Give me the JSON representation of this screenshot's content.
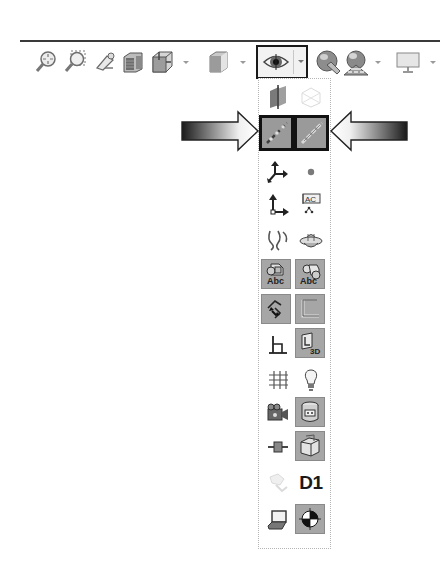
{
  "toolbar": {
    "items": [
      {
        "name": "zoom-to-fit",
        "icon": "zoom-to-fit-icon",
        "has_dropdown": false
      },
      {
        "name": "zoom-to-area",
        "icon": "zoom-to-area-icon",
        "has_dropdown": false
      },
      {
        "name": "previous-view",
        "icon": "previous-view-icon",
        "has_dropdown": false
      },
      {
        "name": "section-view",
        "icon": "section-view-icon",
        "has_dropdown": false
      },
      {
        "name": "view-orientation",
        "icon": "view-orientation-icon",
        "has_dropdown": true
      },
      {
        "name": "display-style",
        "icon": "display-style-icon",
        "has_dropdown": true
      },
      {
        "name": "hide-show-items",
        "icon": "eye-icon",
        "has_dropdown": true,
        "active": true
      },
      {
        "name": "edit-appearance",
        "icon": "edit-appearance-icon",
        "has_dropdown": false
      },
      {
        "name": "apply-scene",
        "icon": "apply-scene-icon",
        "has_dropdown": true
      },
      {
        "name": "view-settings",
        "icon": "monitor-icon",
        "has_dropdown": true
      }
    ]
  },
  "flyout": {
    "title": "Hide/Show Items",
    "rows": [
      [
        {
          "name": "view-planes",
          "pressed": false
        },
        {
          "name": "view-sketch-planes",
          "pressed": false,
          "disabled": true
        }
      ],
      [
        {
          "name": "view-axes",
          "pressed": true,
          "highlighted": true
        },
        {
          "name": "view-temporary-axes",
          "pressed": true,
          "highlighted": true
        }
      ],
      [
        {
          "name": "view-origins",
          "pressed": false
        },
        {
          "name": "view-points",
          "pressed": false
        }
      ],
      [
        {
          "name": "view-coordinate-systems",
          "pressed": false
        },
        {
          "name": "view-dimension-names",
          "pressed": false,
          "text": "AC"
        }
      ],
      [
        {
          "name": "view-curves",
          "pressed": false
        },
        {
          "name": "view-parting-lines",
          "pressed": false
        }
      ],
      [
        {
          "name": "view-annotations",
          "pressed": true
        },
        {
          "name": "view-all-annotations",
          "pressed": true,
          "text": "Abc"
        }
      ],
      [
        {
          "name": "view-sketch-relations",
          "pressed": true
        },
        {
          "name": "view-sketches",
          "pressed": true
        }
      ],
      [
        {
          "name": "view-3d-sketch-planes",
          "pressed": false
        },
        {
          "name": "view-3d-sketches",
          "pressed": true,
          "text": "3D"
        }
      ],
      [
        {
          "name": "view-grid",
          "pressed": false
        },
        {
          "name": "view-lights",
          "pressed": false
        }
      ],
      [
        {
          "name": "view-cameras",
          "pressed": false
        },
        {
          "name": "view-decals",
          "pressed": true
        }
      ],
      [
        {
          "name": "view-routing-points",
          "pressed": false
        },
        {
          "name": "view-parts",
          "pressed": true
        }
      ],
      [
        {
          "name": "view-sketch-dimensions",
          "pressed": false,
          "disabled": true
        },
        {
          "name": "view-dimension-names-text",
          "pressed": false,
          "text": "D1"
        }
      ],
      [
        {
          "name": "view-render-window",
          "pressed": false
        },
        {
          "name": "view-center-of-mass",
          "pressed": true
        }
      ]
    ]
  },
  "annotations": {
    "left_arrow": "pointer-arrow-right",
    "right_arrow": "pointer-arrow-left"
  },
  "colors": {
    "highlight_border": "#111111",
    "pressed_bg": "#a6a6a6",
    "panel_border": "#b5b5b5"
  }
}
